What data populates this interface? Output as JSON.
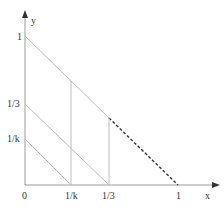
{
  "diagram": {
    "axes": {
      "x_label": "x",
      "y_label": "y",
      "origin_label": "0"
    },
    "y_ticks": [
      {
        "label": "1",
        "value": 1
      },
      {
        "label": "1/3",
        "value": 0.3333
      },
      {
        "label": "1/k",
        "value": 0.2
      }
    ],
    "x_ticks": [
      {
        "label": "1/k",
        "value": 0.2
      },
      {
        "label": "1/3",
        "value": 0.3333
      },
      {
        "label": "1",
        "value": 1
      }
    ],
    "lines": [
      {
        "name": "diagonal-1",
        "from": [
          0,
          1
        ],
        "to": [
          1,
          0
        ],
        "style": "solid",
        "note": "dashed beyond x=1/3"
      },
      {
        "name": "diagonal-1-3",
        "from": [
          0,
          0.3333
        ],
        "to": [
          0.3333,
          0
        ],
        "style": "solid"
      },
      {
        "name": "diagonal-1-k",
        "from": [
          0,
          0.2
        ],
        "to": [
          0.2,
          0
        ],
        "style": "solid"
      },
      {
        "name": "vertical-1-k",
        "x": 0.2,
        "style": "solid"
      },
      {
        "name": "vertical-1-3",
        "x": 0.3333,
        "style": "solid"
      }
    ],
    "colors": {
      "axis": "#9a9a9a",
      "line": "#bdbdbd",
      "dashed": "#333333",
      "text": "#333333"
    }
  }
}
